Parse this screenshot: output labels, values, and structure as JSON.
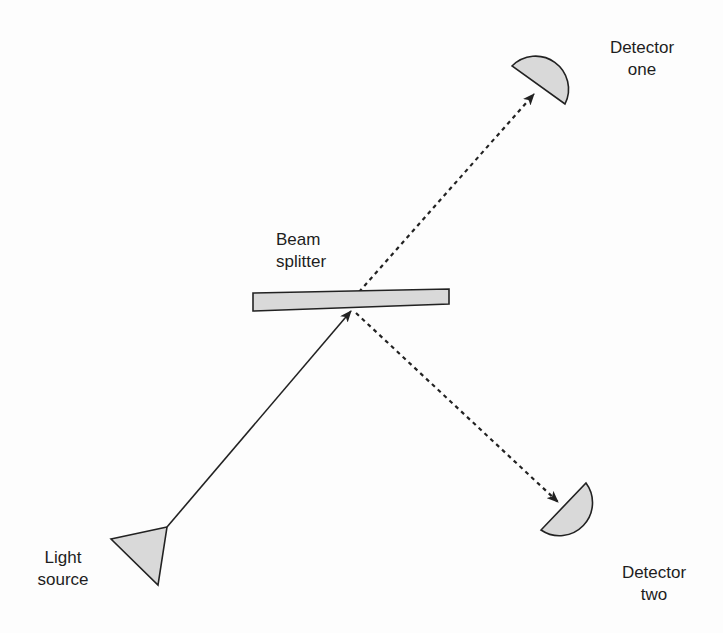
{
  "diagram": {
    "type": "beam-splitter-experiment",
    "colors": {
      "background": "#fdfdfd",
      "shape_fill": "#d9d9d9",
      "stroke": "#222222",
      "text": "#1e1e1e"
    },
    "labels": {
      "light_source": {
        "line1": "Light",
        "line2": "source"
      },
      "beam_splitter": {
        "line1": "Beam",
        "line2": "splitter"
      },
      "detector_one": {
        "line1": "Detector",
        "line2": "one"
      },
      "detector_two": {
        "line1": "Detector",
        "line2": "two"
      }
    },
    "components": [
      {
        "id": "light-source",
        "shape": "triangle",
        "label": "Light source"
      },
      {
        "id": "beam-splitter",
        "shape": "rectangle",
        "label": "Beam splitter"
      },
      {
        "id": "detector-one",
        "shape": "half-disc",
        "label": "Detector one"
      },
      {
        "id": "detector-two",
        "shape": "half-disc",
        "label": "Detector two"
      }
    ],
    "beams": [
      {
        "from": "light-source",
        "to": "beam-splitter",
        "style": "solid",
        "arrow": true
      },
      {
        "from": "beam-splitter",
        "to": "detector-one",
        "style": "dashed",
        "arrow": true
      },
      {
        "from": "beam-splitter",
        "to": "detector-two",
        "style": "dashed",
        "arrow": true
      }
    ]
  }
}
